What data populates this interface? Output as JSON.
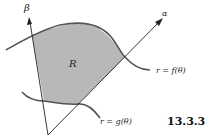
{
  "figure": {
    "number": "13.3.3",
    "region_label": "R",
    "ray_alpha_label": "α",
    "ray_beta_label": "β",
    "outer_curve_label": "r = f(θ)",
    "inner_curve_label": "r = g(θ)"
  },
  "colors": {
    "region_fill": "#b8b8b8",
    "curve_stroke": "#555555",
    "axis_stroke": "#222222",
    "background": "#ffffff"
  }
}
